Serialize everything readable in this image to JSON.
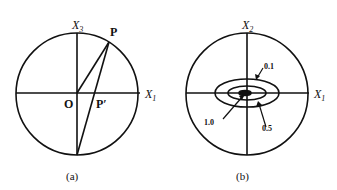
{
  "panel_a": {
    "axis_vertical": "X",
    "axis_vertical_sub": "3",
    "axis_horizontal": "X",
    "axis_horizontal_sub": "1",
    "point_p": "P",
    "point_p_prime": "P′",
    "origin": "O",
    "caption": "(a)"
  },
  "panel_b": {
    "axis_vertical": "X",
    "axis_vertical_sub": "2",
    "axis_horizontal": "X",
    "axis_horizontal_sub": "1",
    "contour_labels": [
      "0.1",
      "0.5",
      "1.0"
    ],
    "caption": "(b)"
  },
  "colors": {
    "stroke": "#111111",
    "background": "#ffffff"
  }
}
